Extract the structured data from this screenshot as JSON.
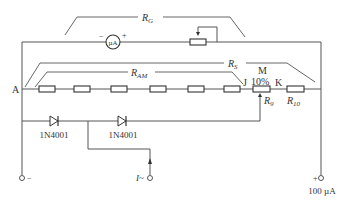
{
  "diagram": {
    "type": "circuit schematic",
    "labels": {
      "rg": "R",
      "rg_sub": "G",
      "rs": "R",
      "rs_sub": "S",
      "ram": "R",
      "ram_sub": "AM",
      "r9": "R",
      "r9_sub": "9",
      "r10": "R",
      "r10_sub": "10",
      "node_a": "A",
      "node_j": "J",
      "node_m": "M",
      "node_k": "K",
      "tap_percent": "10%",
      "meter": "µA",
      "meter_minus": "−",
      "meter_plus": "+",
      "diode1": "1N4001",
      "diode2": "1N4001",
      "input_current": "I~",
      "terminal_minus": "−",
      "terminal_plus": "+",
      "terminal_range": "100 µA"
    },
    "components": [
      {
        "id": "microammeter",
        "kind": "meter",
        "label": "µA"
      },
      {
        "id": "rg-variable",
        "kind": "variable-resistor",
        "group": "R_G"
      },
      {
        "id": "ram-chain",
        "kind": "resistor-chain",
        "count": 6,
        "group": "R_AM"
      },
      {
        "id": "r9",
        "kind": "potentiometer",
        "tap": "10%"
      },
      {
        "id": "r10",
        "kind": "resistor"
      },
      {
        "id": "d1",
        "kind": "diode",
        "part": "1N4001"
      },
      {
        "id": "d2",
        "kind": "diode",
        "part": "1N4001"
      }
    ],
    "colors": {
      "line": "#555555",
      "text": "#333333",
      "background": "#ffffff"
    }
  }
}
